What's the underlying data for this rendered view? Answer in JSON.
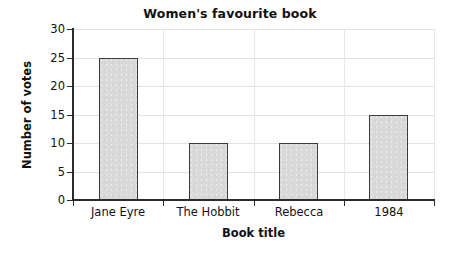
{
  "chart_data": {
    "type": "bar",
    "title": "Women's favourite book",
    "xlabel": "Book title",
    "ylabel": "Number of votes",
    "categories": [
      "Jane Eyre",
      "The Hobbit",
      "Rebecca",
      "1984"
    ],
    "values": [
      25,
      10,
      10,
      15
    ],
    "ylim": [
      0,
      30
    ],
    "yticks": [
      0,
      5,
      10,
      15,
      20,
      25,
      30
    ],
    "ytick_labels": [
      "0",
      "5",
      "10",
      "15",
      "20",
      "25",
      "30"
    ],
    "grid": true,
    "legend": null,
    "bar_fill_color": "#d9d9d9",
    "bar_edge_color": "#3a3a3a",
    "axis_color": "#2b2b2b",
    "gridline_color": "#e2e2e2",
    "background_color": "#ffffff"
  }
}
